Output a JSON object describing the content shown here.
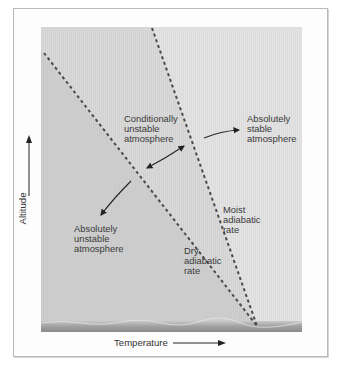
{
  "figure": {
    "axes": {
      "x_label": "Temperature",
      "y_label": "Altitude"
    },
    "lines": [
      {
        "name": "dry-adiabatic-line",
        "label": "Dry\nadiabatic\nrate"
      },
      {
        "name": "moist-adiabatic-line",
        "label": "Moist\nadiabatic\nrate"
      }
    ],
    "regions": [
      {
        "name": "absolutely-unstable",
        "label": "Absolutely\nunstable\natmosphere"
      },
      {
        "name": "conditionally-unstable",
        "label": "Conditionally\nunstable\natmosphere"
      },
      {
        "name": "absolutely-stable",
        "label": "Absolutely\nstable\natmosphere"
      }
    ],
    "colors": {
      "unstable_region": "#cfcfcf",
      "conditional_region": "#d9d9d9",
      "stable_region": "#e3e3e3",
      "dashed_line": "#4a4a4a",
      "ground": "#9a9a9a",
      "frame": "#b9b9b9"
    }
  }
}
